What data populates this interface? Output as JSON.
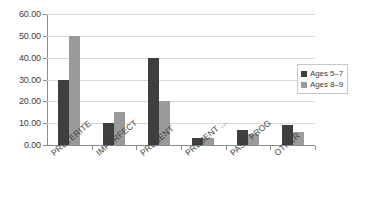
{
  "chart_data": {
    "type": "bar",
    "title": "",
    "subtitle": "",
    "xlabel": "",
    "ylabel": "",
    "ylim": [
      0,
      60
    ],
    "ytick_step": 10,
    "grid": true,
    "legend_position": "right",
    "categories": [
      "PRETERITE",
      "IMPERFECT",
      "PRESENT",
      "PRESENT ...",
      "PAST PROG",
      "OTHER"
    ],
    "ytick_labels": [
      "60.00",
      "50.00",
      "40.00",
      "30.00",
      "20.00",
      "10.00",
      "0.00"
    ],
    "ytick_values": [
      60,
      50,
      40,
      30,
      20,
      10,
      0
    ],
    "series": [
      {
        "name": "Ages 5–7",
        "color": "#3f3f3f",
        "values": [
          30,
          10,
          40,
          3,
          7,
          9
        ]
      },
      {
        "name": "Ages 8–9",
        "color": "#9a9a9a",
        "values": [
          50,
          15,
          20,
          3,
          5,
          6
        ]
      }
    ]
  },
  "legend": {
    "entries": [
      "Ages 5–7",
      "Ages 8–9"
    ]
  }
}
